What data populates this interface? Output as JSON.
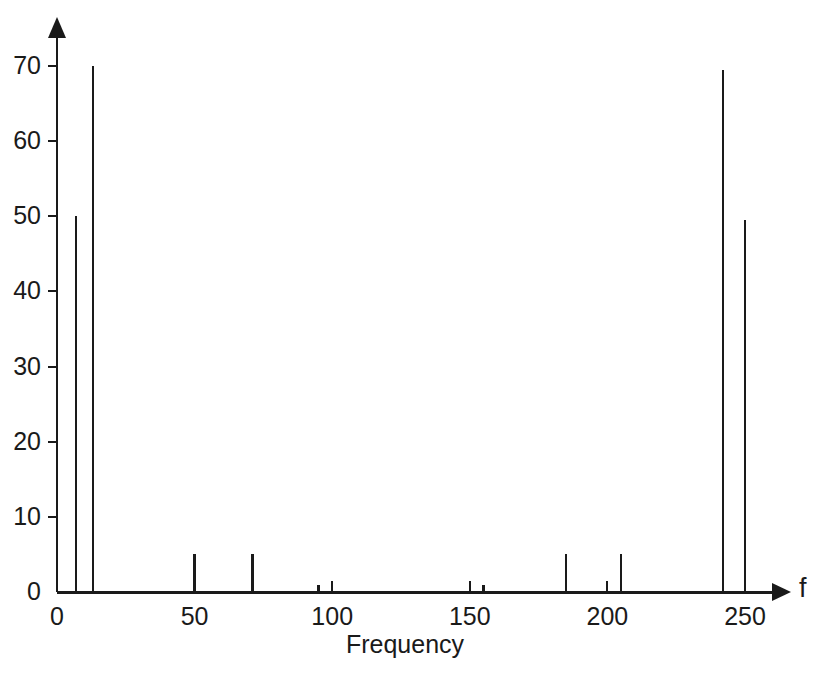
{
  "chart_data": {
    "type": "bar",
    "title": "",
    "subtitle": "",
    "xlabel": "Frequency",
    "ylabel": "",
    "axis_symbol_x": "f",
    "xlim": [
      0,
      262
    ],
    "ylim": [
      0,
      75
    ],
    "xticks": [
      0,
      50,
      100,
      150,
      200,
      250
    ],
    "xtick_labels": [
      "0",
      "50",
      "100",
      "150",
      "200",
      "250"
    ],
    "yticks": [
      0,
      10,
      20,
      30,
      40,
      50,
      60,
      70
    ],
    "ytick_labels": [
      "0",
      "10",
      "20",
      "30",
      "40",
      "50",
      "60",
      "70"
    ],
    "grid": false,
    "legend": "none",
    "line_color": "#1a1a1a",
    "background_color": "#ffffff",
    "x": [
      7,
      13,
      50,
      71,
      95,
      155,
      185,
      205,
      242,
      250
    ],
    "values": [
      50.0,
      70.0,
      5.0,
      5.0,
      0.9,
      0.9,
      5.0,
      5.0,
      69.5,
      49.5
    ],
    "series": [
      {
        "name": "spectrum",
        "x": [
          7,
          13,
          50,
          71,
          95,
          155,
          185,
          205,
          242,
          250
        ],
        "values": [
          50.0,
          70.0,
          5.0,
          5.0,
          0.9,
          0.9,
          5.0,
          5.0,
          69.5,
          49.5
        ]
      }
    ],
    "annotations": []
  },
  "axis": {
    "x_symbol": "f",
    "x_title": "Frequency"
  }
}
